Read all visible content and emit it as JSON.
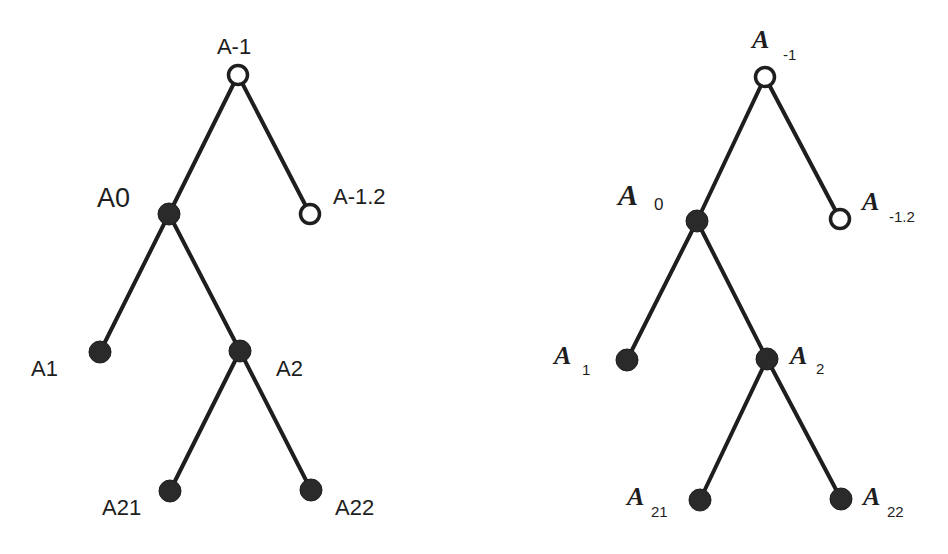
{
  "colors": {
    "ink": "#1e1e1e",
    "node_fill": "#2a2a2a",
    "open_fill": "#ffffff",
    "background": "#ffffff"
  },
  "left_tree": {
    "style": "plain-labels",
    "nodes": [
      {
        "id": "A-1",
        "label": "A-1",
        "type": "open",
        "x": 238,
        "y": 75,
        "lx": 234,
        "ly": 54,
        "anchor": "middle",
        "size": 22
      },
      {
        "id": "A0",
        "label": "A0",
        "type": "filled",
        "x": 169,
        "y": 214,
        "lx": 97,
        "ly": 207,
        "anchor": "start",
        "size": 27
      },
      {
        "id": "A-1.2",
        "label": "A-1.2",
        "type": "open",
        "x": 310,
        "y": 214,
        "lx": 333,
        "ly": 204,
        "anchor": "start",
        "size": 22
      },
      {
        "id": "A1",
        "label": "A1",
        "type": "filled",
        "x": 100,
        "y": 352,
        "lx": 31,
        "ly": 376,
        "anchor": "start",
        "size": 22
      },
      {
        "id": "A2",
        "label": "A2",
        "type": "filled",
        "x": 240,
        "y": 351,
        "lx": 276,
        "ly": 376,
        "anchor": "start",
        "size": 22
      },
      {
        "id": "A21",
        "label": "A21",
        "type": "filled",
        "x": 170,
        "y": 491,
        "lx": 102,
        "ly": 515,
        "anchor": "start",
        "size": 22
      },
      {
        "id": "A22",
        "label": "A22",
        "type": "filled",
        "x": 311,
        "y": 490,
        "lx": 335,
        "ly": 515,
        "anchor": "start",
        "size": 22
      }
    ],
    "edges": [
      [
        "A-1",
        "A0"
      ],
      [
        "A-1",
        "A-1.2"
      ],
      [
        "A0",
        "A1"
      ],
      [
        "A0",
        "A2"
      ],
      [
        "A2",
        "A21"
      ],
      [
        "A2",
        "A22"
      ]
    ]
  },
  "right_tree": {
    "style": "subscript-labels",
    "nodes": [
      {
        "id": "A_-1",
        "base": "A",
        "sub": "-1",
        "type": "open",
        "x": 765,
        "y": 77,
        "lx": 752,
        "ly": 48,
        "sx": 783,
        "sy": 60,
        "size": 22,
        "subsize": 15
      },
      {
        "id": "A_0",
        "base": "A",
        "sub": "0",
        "type": "filled",
        "x": 697,
        "y": 221,
        "lx": 618,
        "ly": 205,
        "sx": 654,
        "sy": 210,
        "size": 26,
        "subsize": 17
      },
      {
        "id": "A_-1.2",
        "base": "A",
        "sub": "-1.2",
        "type": "open",
        "x": 840,
        "y": 219,
        "lx": 862,
        "ly": 210,
        "sx": 889,
        "sy": 222,
        "size": 22,
        "subsize": 15
      },
      {
        "id": "A_1",
        "base": "A",
        "sub": "1",
        "type": "filled",
        "x": 627,
        "y": 360,
        "lx": 554,
        "ly": 364,
        "sx": 582,
        "sy": 375,
        "size": 22,
        "subsize": 15
      },
      {
        "id": "A_2",
        "base": "A",
        "sub": "2",
        "type": "filled",
        "x": 767,
        "y": 359,
        "lx": 790,
        "ly": 364,
        "sx": 816,
        "sy": 374,
        "size": 22,
        "subsize": 15
      },
      {
        "id": "A_21",
        "base": "A",
        "sub": "21",
        "type": "filled",
        "x": 700,
        "y": 500,
        "lx": 627,
        "ly": 505,
        "sx": 651,
        "sy": 517,
        "size": 22,
        "subsize": 15
      },
      {
        "id": "A_22",
        "base": "A",
        "sub": "22",
        "type": "filled",
        "x": 841,
        "y": 499,
        "lx": 863,
        "ly": 505,
        "sx": 887,
        "sy": 517,
        "size": 22,
        "subsize": 15
      }
    ],
    "edges": [
      [
        "A_-1",
        "A_0"
      ],
      [
        "A_-1",
        "A_-1.2"
      ],
      [
        "A_0",
        "A_1"
      ],
      [
        "A_0",
        "A_2"
      ],
      [
        "A_2",
        "A_21"
      ],
      [
        "A_2",
        "A_22"
      ]
    ]
  }
}
